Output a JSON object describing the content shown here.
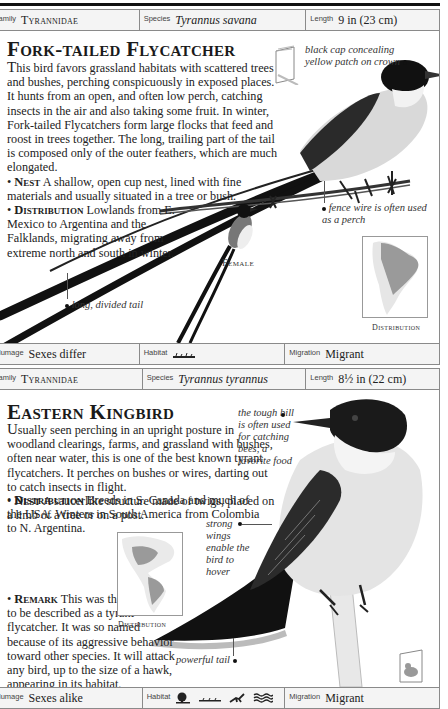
{
  "page": {
    "entries": [
      {
        "infobar_top": {
          "family_label": "Family",
          "family_value": "Tyrannidae",
          "species_label": "Species",
          "species_value": "Tyrannus savana",
          "length_label": "Length",
          "length_value": "9 in (23 cm)"
        },
        "title": "Fork-tailed Flycatcher",
        "intro_dropcap": "T",
        "intro": "his bird favors grassland habitats with scattered trees and bushes, perching conspicuously in exposed places. It hunts from an open, and often low perch, catching insects in the air and also taking some fruit. In winter, Fork-tailed Flycatchers form large flocks that feed and roost in trees together. The long, trailing part of the tail is composed only of the outer feathers, which are much elongated.",
        "sections": [
          {
            "bullet": "•",
            "heading": "Nest",
            "text": "A shallow, open cup nest, lined with fine materials and usually situated in a tree or bush."
          },
          {
            "bullet": "•",
            "heading": "Distribution",
            "text": "Lowlands from E. Mexico to Argentina and the Falklands, migrating away from extreme north and south in winter."
          }
        ],
        "annotations": {
          "cap": "black cap concealing yellow patch on crown",
          "fence": "fence wire is often used as a perch",
          "tail": "long, divided tail"
        },
        "female_caption": "Female",
        "map_caption": "Distribution",
        "infobar_bottom": {
          "plumage_label": "Plumage",
          "plumage_value": "Sexes differ",
          "habitat_label": "Habitat",
          "habitat_icons": [
            "grassland-icon"
          ],
          "migration_label": "Migration",
          "migration_value": "Migrant"
        }
      },
      {
        "infobar_top": {
          "family_label": "Family",
          "family_value": "Tyrannidae",
          "species_label": "Species",
          "species_value": "Tyrannus tyrannus",
          "length_label": "Length",
          "length_value": "8½ in (22 cm)"
        },
        "title": "Eastern Kingbird",
        "intro_dropcap": "U",
        "intro": "sually seen perching in an upright posture in woodland clearings, farms, and grassland with bushes, often near water, this is one of the best known tyrant flycatchers. It perches on bushes or wires, darting out to catch insects in flight.",
        "sections": [
          {
            "bullet": "•",
            "heading": "Nest",
            "text": "A saucerlike structure made of twigs, placed on a limb of a tree or on a post."
          },
          {
            "bullet": "•",
            "heading": "Distribution",
            "text": "Breeds in S. Canada and much of the USA. Winters in South America from Colombia to N. Argentina."
          },
          {
            "bullet": "•",
            "heading": "Remark",
            "text": "This was the first bird to be described as a tyrant flycatcher. It was so named because of its aggressive behavior toward other species. It will attack any bird, up to the size of a hawk, appearing in its habitat."
          }
        ],
        "annotations": {
          "bill": "the tough bill is often used for catching bees, a favorite food",
          "wings": "strong wings enable the bird to hover",
          "tail": "powerful tail"
        },
        "map_caption": "Distribution",
        "infobar_bottom": {
          "plumage_label": "Plumage",
          "plumage_value": "Sexes alike",
          "habitat_label": "Habitat",
          "habitat_icons": [
            "woodland-icon",
            "grassland-icon",
            "farmland-icon",
            "wetland-icon"
          ],
          "migration_label": "Migration",
          "migration_value": "Migrant"
        }
      }
    ]
  }
}
